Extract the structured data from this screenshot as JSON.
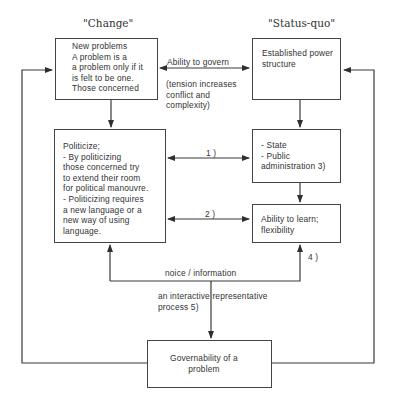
{
  "headings": {
    "change": "\"Change\"",
    "status_quo": "\"Status-quo\""
  },
  "boxes": {
    "new_problems": "New problems\nA problem is a\na problem only if it\nis felt to be one.\nThose concerned",
    "established": "Established power\nstructure",
    "politicize": "Politicize;\n- By politicizing\nthose concerned try\nto extend their room\nfor political manouvre.\n- Politicizing requires\na new language or a\nnew way of using\nlanguage.",
    "state": "- State\n- Public\nadministration  3)",
    "learn": "Ability to learn;\nflexibility",
    "governability": "Governability of a\nproblem"
  },
  "labels": {
    "ability_to_govern": "Ability to govern",
    "tension": "(tension increases\nconflict and\ncomplexity)",
    "link1": "1 )",
    "link2": "2 )",
    "link4": "4 )",
    "noice": "noice / information",
    "process": "an interactive representative\nprocess 5)"
  },
  "colors": {
    "line": "#3a3a3a",
    "text": "#333333"
  }
}
